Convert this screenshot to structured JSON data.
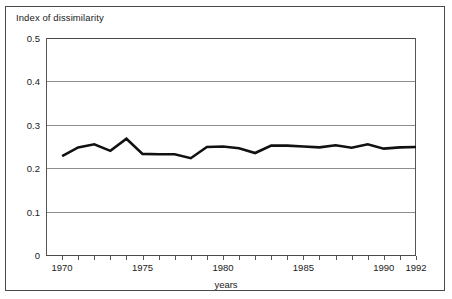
{
  "figure": {
    "y_axis_title": "Index of dissimilarity",
    "x_axis_title": "years"
  },
  "chart_data": {
    "type": "line",
    "title": "",
    "subtitle": "",
    "xlabel": "years",
    "ylabel": "Index of dissimilarity",
    "xlim": [
      1969,
      1992
    ],
    "ylim": [
      0,
      0.5
    ],
    "grid": true,
    "legend": "none",
    "x_tick_labels": [
      "1970",
      "1975",
      "1980",
      "1985",
      "1990",
      "1992"
    ],
    "x_tick_values": [
      1970,
      1975,
      1980,
      1985,
      1990,
      1992
    ],
    "y_tick_labels": [
      "0",
      "0.1",
      "0.2",
      "0.3",
      "0.4",
      "0.5"
    ],
    "y_tick_values": [
      0,
      0.1,
      0.2,
      0.3,
      0.4,
      0.5
    ],
    "x_minor_ticks_every": 1,
    "series": [
      {
        "name": "Index of dissimilarity",
        "color": "#111111",
        "line_width": 2.6,
        "x": [
          1970,
          1971,
          1972,
          1973,
          1974,
          1975,
          1976,
          1977,
          1978,
          1979,
          1980,
          1981,
          1982,
          1983,
          1984,
          1985,
          1986,
          1987,
          1988,
          1989,
          1990,
          1991,
          1992
        ],
        "values": [
          0.228,
          0.248,
          0.255,
          0.24,
          0.268,
          0.233,
          0.232,
          0.232,
          0.223,
          0.249,
          0.25,
          0.246,
          0.235,
          0.252,
          0.252,
          0.25,
          0.248,
          0.253,
          0.247,
          0.255,
          0.245,
          0.248,
          0.249
        ]
      }
    ]
  }
}
